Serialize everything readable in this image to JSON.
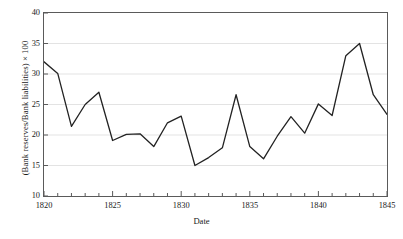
{
  "chart_data": {
    "type": "line",
    "title": "",
    "xlabel": "Date",
    "ylabel": "(Bank reserves/Bank liabilities) × 100",
    "xlim": [
      1820,
      1845
    ],
    "ylim": [
      10,
      40
    ],
    "grid": "horizontal",
    "legend": "none",
    "line_color": "#222222",
    "grid_color": "#e3e3e3",
    "axis_color": "#5a5a5a",
    "xticks": [
      1820,
      1825,
      1830,
      1835,
      1840,
      1845
    ],
    "xtick_labels": [
      "1820",
      "1825",
      "1830",
      "1835",
      "1840",
      "1845"
    ],
    "xminor_tick_step": 1,
    "yticks": [
      10,
      15,
      20,
      25,
      30,
      35,
      40
    ],
    "ytick_labels": [
      "10",
      "15",
      "20",
      "25",
      "30",
      "35",
      "40"
    ],
    "x": [
      1820,
      1821,
      1822,
      1823,
      1824,
      1825,
      1826,
      1827,
      1828,
      1829,
      1830,
      1831,
      1832,
      1833,
      1834,
      1835,
      1836,
      1837,
      1838,
      1839,
      1840,
      1841,
      1842,
      1843,
      1844,
      1845
    ],
    "values": [
      32.0,
      30.1,
      21.4,
      25.0,
      27.0,
      19.1,
      20.1,
      20.2,
      18.1,
      22.0,
      23.1,
      15.0,
      16.3,
      17.9,
      26.6,
      18.1,
      16.1,
      19.8,
      23.0,
      20.3,
      25.1,
      23.2,
      33.0,
      35.0,
      26.6,
      23.4
    ],
    "series_name": "Bank reserve ratio"
  }
}
